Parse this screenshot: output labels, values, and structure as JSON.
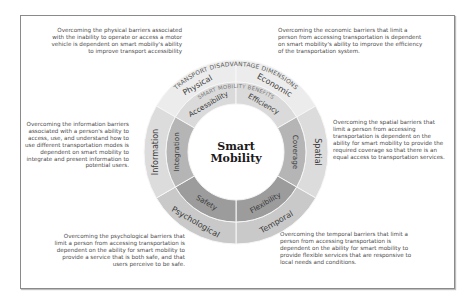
{
  "center": {
    "line1": "Smart",
    "line2": "Mobility"
  },
  "outer_ring_title": "TRANSPORT DISADVANTAGE DIMENSIONS",
  "inner_ring_title": "SMART MOBILITY BENEFITS",
  "segments": [
    {
      "dimension": "Physical",
      "benefit": "Accessibility",
      "description": "Overcoming the physical barriers associated with the inability to operate or access a motor vehicle is dependent on smart mobiliy's ability to improve transport accessibility"
    },
    {
      "dimension": "Economic",
      "benefit": "Efficiency",
      "description": "Overcoming the economic barriers that limit a person from accessing transportation is dependent on smart mobility's ability to improve the efficiency of the transportation system."
    },
    {
      "dimension": "Spatial",
      "benefit": "Coverage",
      "description": "Overcoming the spatial barriers that limit a person from accessing transportation is dependent on the ability for smart mobility to provide the required coverage so that there is an equal access to transportation services."
    },
    {
      "dimension": "Temporal",
      "benefit": "Flexibility",
      "description": "Overcoming the temporal barriers that limit a person from accessing transportation is dependent on the ability for smart mobility to provide flexible services that are responsive to local needs and conditions."
    },
    {
      "dimension": "Psychological",
      "benefit": "Safety",
      "description": "Overcoming the psychological barriers that limit a person from accessing transportation is dependent on the ability for smart mobility to provide a service that is both safe, and that users perceive to be safe."
    },
    {
      "dimension": "Information",
      "benefit": "Integration",
      "description": "Overcoming the information barriers associated with a person's ability to access, use, and understand how to use different transportation modes is dependent on smart mobility to integrate and present information to potential users."
    }
  ],
  "colors": {
    "outer": [
      "#ececec",
      "#ececec",
      "#dcdcdc",
      "#c9c9c9",
      "#c9c9c9",
      "#dcdcdc"
    ],
    "inner": [
      "#dadada",
      "#dadada",
      "#b5b5b5",
      "#9c9c9c",
      "#9c9c9c",
      "#b5b5b5"
    ],
    "center": "#ffffff",
    "text": "#3a3a3a",
    "divider": "#f7f7f7"
  }
}
